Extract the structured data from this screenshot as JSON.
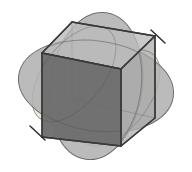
{
  "figure": {
    "canvas": {
      "width": 192,
      "height": 172,
      "background": "#ffffff"
    },
    "colors": {
      "background": "#ffffff",
      "petal_light": "#eceae2",
      "petal_medium": "#b4b4b4",
      "petal_overlap": "#a8a8a8",
      "cube_top": "#b9b9b9",
      "cube_right": "#a6a6a6",
      "cube_front": "#6e6e6e",
      "cube_front_over_disc": "#6a6a6a",
      "outline": "#3c3c3c",
      "outline_soft": "#6a6a6a"
    },
    "stroke": {
      "cube_edge_width": 1.4,
      "petal_edge_width": 1.0,
      "axis_tick_width": 1.4
    },
    "petals": [
      {
        "name": "petal-upper-left",
        "fill": "#eceae2",
        "cx": 74,
        "cy": 74,
        "rx": 56,
        "ry": 30,
        "rotation": -52
      },
      {
        "name": "petal-lower-right",
        "fill": "#eceae2",
        "cx": 118,
        "cy": 98,
        "rx": 56,
        "ry": 30,
        "rotation": -52
      },
      {
        "name": "petal-horizontal",
        "fill": "#b4b4b4",
        "cx": 96,
        "cy": 86,
        "rx": 78,
        "ry": 46,
        "rotation": 8
      },
      {
        "name": "petal-vertical",
        "fill": "#b4b4b4",
        "cx": 96,
        "cy": 86,
        "rx": 46,
        "ry": 74,
        "rotation": 8
      }
    ],
    "cube": {
      "name": "isometric-cube",
      "vertices": {
        "front_top_left": [
          42,
          53
        ],
        "front_top_right": [
          121,
          69
        ],
        "front_bottom_right": [
          121,
          146
        ],
        "front_bottom_left": [
          42,
          137
        ],
        "back_top_left": [
          72,
          22
        ],
        "back_top_right": [
          155,
          36
        ],
        "back_bottom_right": [
          155,
          118
        ]
      },
      "faces": [
        {
          "name": "cube-top-face",
          "fill": "#b9b9b9"
        },
        {
          "name": "cube-right-face",
          "fill": "#a6a6a6"
        },
        {
          "name": "cube-front-face",
          "fill": "#6e6e6e"
        }
      ]
    },
    "axis_ticks": [
      {
        "name": "axis-tick-top-right",
        "x1": 151,
        "y1": 30,
        "x2": 165,
        "y2": 43
      },
      {
        "name": "axis-tick-bottom-left",
        "x1": 30,
        "y1": 126,
        "x2": 45,
        "y2": 140
      }
    ]
  }
}
